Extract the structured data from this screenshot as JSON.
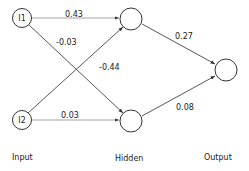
{
  "diagram": {
    "title": "",
    "nodes": [
      {
        "id": "I1",
        "label": "I1",
        "layer": "input"
      },
      {
        "id": "I2",
        "label": "I2",
        "layer": "input"
      },
      {
        "id": "H1",
        "label": "",
        "layer": "hidden"
      },
      {
        "id": "H2",
        "label": "",
        "layer": "hidden"
      },
      {
        "id": "O1",
        "label": "",
        "layer": "output"
      }
    ],
    "edges": [
      {
        "from": "I1",
        "to": "H1",
        "weight": "0.43"
      },
      {
        "from": "I1",
        "to": "H2",
        "weight": "-0.03"
      },
      {
        "from": "I2",
        "to": "H1",
        "weight": "-0.44"
      },
      {
        "from": "I2",
        "to": "H2",
        "weight": "0.03"
      },
      {
        "from": "H1",
        "to": "O1",
        "weight": "0.27"
      },
      {
        "from": "H2",
        "to": "O1",
        "weight": "0.08"
      }
    ],
    "layers": [
      {
        "id": "input",
        "label": "Input"
      },
      {
        "id": "hidden",
        "label": "Hidden"
      },
      {
        "id": "output",
        "label": "Output"
      }
    ]
  }
}
